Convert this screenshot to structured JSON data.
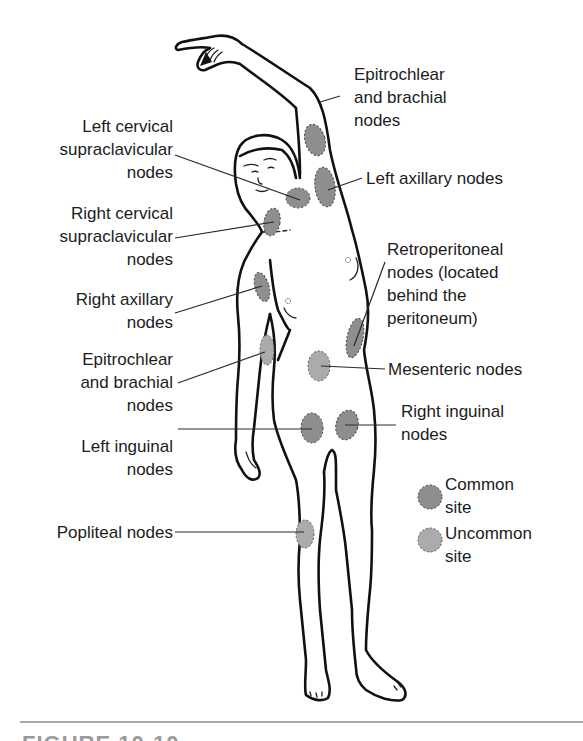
{
  "figure": {
    "colors": {
      "common_site_fill": "#8e8e8e",
      "uncommon_site_fill": "#ababab",
      "outline": "#111111",
      "separator": "#a8a8a8"
    }
  },
  "labels": {
    "epitrochlear_brachial_upper": "Epitrochlear\nand brachial\nnodes",
    "left_cervical": "Left cervical\nsupraclavicular\nnodes",
    "left_axillary": "Left axillary nodes",
    "right_cervical": "Right cervical\nsupraclavicular\nnodes",
    "retroperitoneal": "Retroperitoneal\nnodes (located\nbehind the\nperitoneum)",
    "right_axillary": "Right axillary\nnodes",
    "epitrochlear_brachial_lower": "Epitrochlear\nand brachial\nnodes",
    "mesenteric": "Mesenteric nodes",
    "right_inguinal": "Right inguinal\nnodes",
    "left_inguinal": "Left inguinal\nnodes",
    "popliteal": "Popliteal nodes"
  },
  "legend": {
    "items": [
      {
        "label": "Common\nsite",
        "type": "common",
        "color": "#8e8e8e"
      },
      {
        "label": "Uncommon\nsite",
        "type": "uncommon",
        "color": "#ababab"
      }
    ]
  },
  "caption": {
    "text": "FIGURE 10-10"
  }
}
